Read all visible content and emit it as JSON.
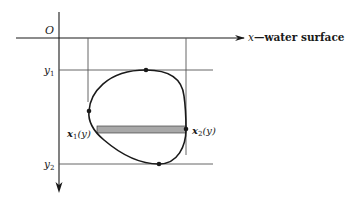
{
  "diagram": {
    "origin_label": "O",
    "x_axis_label": "x",
    "x_axis_suffix": "—water surface",
    "y1_label": "y",
    "y1_sub": "1",
    "y2_label": "y",
    "y2_sub": "2",
    "x1_label": "x",
    "x1_sub": "1",
    "x1_arg": "(y)",
    "x2_label": "x",
    "x2_sub": "2",
    "x2_arg": "(y)",
    "colors": {
      "ink": "#1a1a1a",
      "thin_line": "#555555",
      "strip_fill": "#a8a8a8"
    }
  }
}
